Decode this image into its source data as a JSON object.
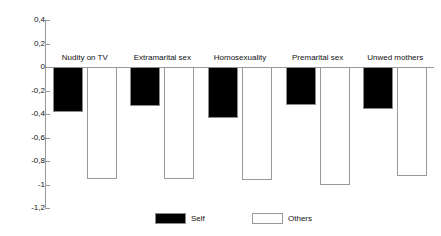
{
  "chart_data": {
    "type": "bar",
    "title": "",
    "subtitle": "",
    "xlabel": "",
    "ylabel": "",
    "ylim": [
      -1.2,
      0.4
    ],
    "grid": false,
    "legend_position": "bottom-center",
    "decimal_separator": "comma",
    "categories": [
      "Nudity on TV",
      "Extramarital sex",
      "Homosexuality",
      "Premarital sex",
      "Unwed mothers"
    ],
    "y_ticks": [
      0.4,
      0.2,
      0,
      -0.2,
      -0.4,
      -0.6,
      -0.8,
      -1,
      -1.2
    ],
    "y_tick_labels": [
      "0,4",
      "0,2",
      "0",
      "-0,2",
      "-0,4",
      "-0,6",
      "-0,8",
      "-1",
      "-1,2"
    ],
    "series": [
      {
        "name": "Self",
        "color": "#000000",
        "values": [
          -0.38,
          -0.33,
          -0.43,
          -0.32,
          -0.36
        ]
      },
      {
        "name": "Others",
        "color": "#ffffff",
        "values": [
          -0.95,
          -0.95,
          -0.96,
          -1.0,
          -0.93
        ]
      }
    ]
  },
  "legend": {
    "items": [
      {
        "label": "Self"
      },
      {
        "label": "Others"
      }
    ]
  },
  "colors": {
    "axis": "#9a9a9a",
    "text": "#111111",
    "self_fill": "#000000",
    "others_fill": "#ffffff",
    "bar_stroke": "#9a9a9a",
    "background": "#ffffff"
  }
}
